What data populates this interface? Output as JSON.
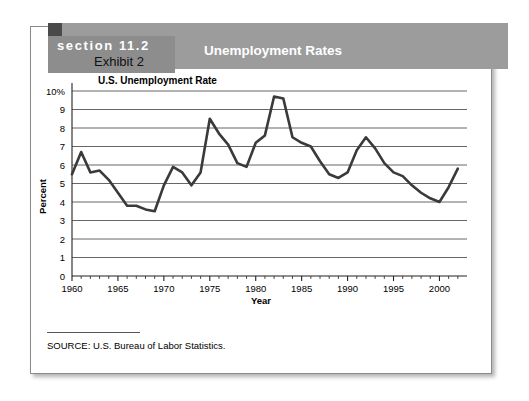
{
  "header": {
    "section_label": "section 11.2",
    "exhibit_label": "Exhibit 2",
    "title": "Unemployment Rates",
    "band_color": "#9c9c9c",
    "tab_color": "#8d8d8d",
    "square_color": "#4a4a4a"
  },
  "footer": {
    "source_text": "SOURCE:   U.S. Bureau of Labor Statistics."
  },
  "chart_data": {
    "type": "line",
    "title": "U.S. Unemployment Rate",
    "xlabel": "Year",
    "ylabel": "Percent",
    "xlim": [
      1960,
      2003
    ],
    "ylim": [
      0,
      10
    ],
    "ytick_labels": [
      "0",
      "1",
      "2",
      "3",
      "4",
      "5",
      "6",
      "7",
      "8",
      "9",
      "10%"
    ],
    "yticks": [
      0,
      1,
      2,
      3,
      4,
      5,
      6,
      7,
      8,
      9,
      10
    ],
    "xtick_labels": [
      "1960",
      "1965",
      "1970",
      "1975",
      "1980",
      "1985",
      "1990",
      "1995",
      "2000"
    ],
    "xticks": [
      1960,
      1965,
      1970,
      1975,
      1980,
      1985,
      1990,
      1995,
      2000
    ],
    "grid": "horizontal",
    "legend": "none",
    "line_color": "#3a3a3a",
    "line_width": 2.6,
    "series": [
      {
        "name": "U.S. Unemployment Rate",
        "x": [
          1960,
          1961,
          1962,
          1963,
          1964,
          1965,
          1966,
          1967,
          1968,
          1969,
          1970,
          1971,
          1972,
          1973,
          1974,
          1975,
          1976,
          1977,
          1978,
          1979,
          1980,
          1981,
          1982,
          1983,
          1984,
          1985,
          1986,
          1987,
          1988,
          1989,
          1990,
          1991,
          1992,
          1993,
          1994,
          1995,
          1996,
          1997,
          1998,
          1999,
          2000,
          2001,
          2002
        ],
        "values": [
          5.5,
          6.7,
          5.6,
          5.7,
          5.2,
          4.5,
          3.8,
          3.8,
          3.6,
          3.5,
          4.9,
          5.9,
          5.6,
          4.9,
          5.6,
          8.5,
          7.7,
          7.1,
          6.1,
          5.9,
          7.2,
          7.6,
          9.7,
          9.6,
          7.5,
          7.2,
          7.0,
          6.2,
          5.5,
          5.3,
          5.6,
          6.8,
          7.5,
          6.9,
          6.1,
          5.6,
          5.4,
          4.9,
          4.5,
          4.2,
          4.0,
          4.8,
          5.8
        ]
      }
    ]
  }
}
